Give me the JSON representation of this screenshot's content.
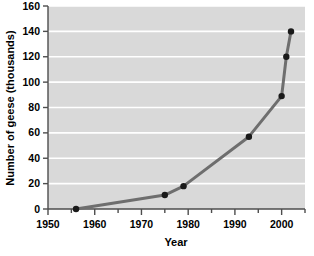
{
  "figure": {
    "name": "geese-population-line-chart",
    "plot_background": "#d9d9d9",
    "gridline_color": "#ffffff",
    "line_color": "#6e6e6e",
    "marker_color": "#1a1a1a",
    "axis_color": "#4d4d4d",
    "text_color": "#000000",
    "page_background": "#ffffff"
  },
  "chart_data": {
    "type": "line",
    "title": "",
    "xlabel": "Year",
    "ylabel": "Number of geese (thousands)",
    "xlim": [
      1950,
      2005
    ],
    "ylim": [
      0,
      160
    ],
    "grid": true,
    "legend": false,
    "x_ticks": [
      1950,
      1960,
      1970,
      1980,
      1990,
      2000
    ],
    "x_minor_ticks": [
      1955,
      1965,
      1975,
      1985,
      1995,
      2005
    ],
    "y_ticks": [
      0,
      20,
      40,
      60,
      80,
      100,
      120,
      140,
      160
    ],
    "x": [
      1956,
      1975,
      1979,
      1993,
      2000,
      2001,
      2002
    ],
    "values": [
      0,
      11,
      18,
      57,
      89,
      120,
      140
    ],
    "series": [
      {
        "name": "Number of geese (thousands)",
        "points": [
          {
            "x": 1956,
            "y": 0
          },
          {
            "x": 1975,
            "y": 11
          },
          {
            "x": 1979,
            "y": 18
          },
          {
            "x": 1993,
            "y": 57
          },
          {
            "x": 2000,
            "y": 89
          },
          {
            "x": 2001,
            "y": 120
          },
          {
            "x": 2002,
            "y": 140
          }
        ]
      }
    ]
  },
  "labels": {
    "x_title": "Year",
    "y_title": "Number of geese (thousands)",
    "x_tick_0": "1950",
    "x_tick_1": "1960",
    "x_tick_2": "1970",
    "x_tick_3": "1980",
    "x_tick_4": "1990",
    "x_tick_5": "2000",
    "y_tick_0": "0",
    "y_tick_1": "20",
    "y_tick_2": "40",
    "y_tick_3": "60",
    "y_tick_4": "80",
    "y_tick_5": "100",
    "y_tick_6": "120",
    "y_tick_7": "140",
    "y_tick_8": "160"
  }
}
